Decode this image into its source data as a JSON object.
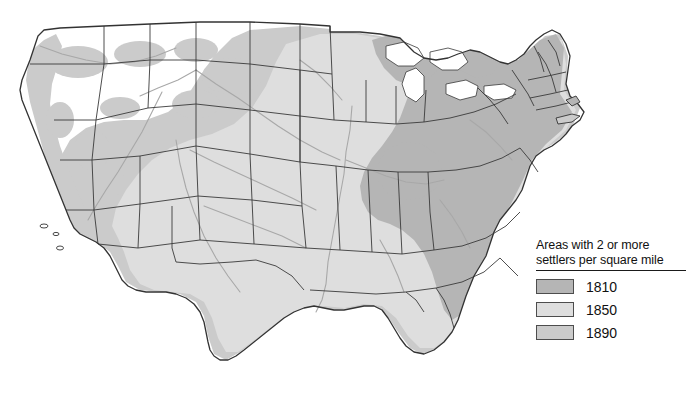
{
  "figure": {
    "kind": "thematic-map",
    "region": "Contiguous United States",
    "background_color": "#ffffff"
  },
  "map": {
    "outline_color": "#333333",
    "state_border_color": "#3a3a3a",
    "river_color": "#a8a8a8",
    "water_color": "#ffffff",
    "unsettled_color": "#ffffff"
  },
  "legend": {
    "title": "Areas with 2 or more\nsettlers per square mile",
    "title_line1": "Areas with 2 or more",
    "title_line2": "settlers per square mile",
    "entries": [
      {
        "label": "1810",
        "color": "#b5b5b5"
      },
      {
        "label": "1850",
        "color": "#dedede"
      },
      {
        "label": "1890",
        "color": "#cbcbcb"
      }
    ]
  }
}
